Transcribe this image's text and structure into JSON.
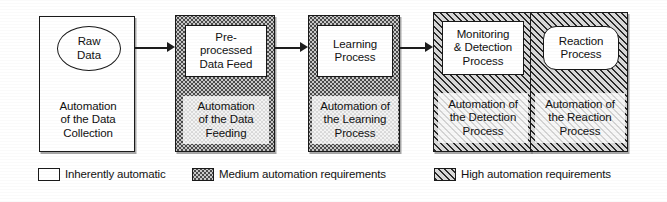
{
  "diagram": {
    "stages": [
      {
        "id": "data-collection",
        "node_label": "Raw\nData",
        "node_shape": "ellipse",
        "caption": "Automation\nof the Data\nCollection",
        "automation_level": "Inherently automatic",
        "fill": "plain"
      },
      {
        "id": "data-feeding",
        "node_label": "Pre-\nprocessed\nData Feed",
        "node_shape": "rectangle",
        "caption": "Automation\nof the Data\nFeeding",
        "automation_level": "Medium automation requirements",
        "fill": "medium"
      },
      {
        "id": "learning",
        "node_label": "Learning\nProcess",
        "node_shape": "rectangle",
        "caption": "Automation of\nthe Learning\nProcess",
        "automation_level": "Medium automation requirements",
        "fill": "medium"
      },
      {
        "id": "monitoring-detection",
        "node_label": "Monitoring\n& Detection\nProcess",
        "node_shape": "rectangle",
        "caption": "Automation of\nthe Detection\nProcess",
        "automation_level": "High automation requirements",
        "fill": "high"
      },
      {
        "id": "reaction",
        "node_label": "Reaction\nProcess",
        "node_shape": "rounded-rectangle",
        "caption": "Automation of\nthe Reaction\nProcess",
        "automation_level": "High automation requirements",
        "fill": "high"
      }
    ],
    "connectors": [
      {
        "from": "data-collection",
        "to": "data-feeding",
        "type": "arrow"
      },
      {
        "from": "data-feeding",
        "to": "learning",
        "type": "arrow"
      },
      {
        "from": "learning",
        "to": "monitoring-detection",
        "type": "arrow"
      },
      {
        "from": "monitoring-detection",
        "to": "reaction",
        "type": "arrow"
      }
    ]
  },
  "legend": {
    "items": [
      {
        "label": "Inherently automatic",
        "fill": "plain"
      },
      {
        "label": "Medium automation requirements",
        "fill": "medium"
      },
      {
        "label": "High automation requirements",
        "fill": "high"
      }
    ]
  },
  "colors": {
    "ink": "#1a1a1a",
    "paper": "#ffffff",
    "medium_fill": "#c9c9c9",
    "high_fill": "#7b7b7b"
  }
}
